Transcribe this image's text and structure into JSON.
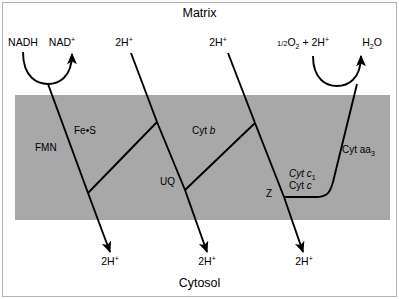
{
  "figure": {
    "width": 399,
    "height": 299
  },
  "colors": {
    "membrane_gray": "#a8a8a8",
    "line_black": "#000000",
    "background": "#ffffff",
    "frame_gray": "#b4b4b4"
  },
  "compartments": {
    "top_label": "Matrix",
    "bottom_label": "Cytosol"
  },
  "membrane": {
    "x": 15,
    "y": 95,
    "width": 375,
    "height": 125
  },
  "substrates": {
    "nadh": "NADH",
    "nad_base": "NAD",
    "nad_charge": "+",
    "oxygen_frac": "1/2",
    "oxygen_base": "O",
    "oxygen_sub": "2",
    "plus": "+",
    "protons_base": "2H",
    "protons_charge": "+",
    "water_base": "H",
    "water_sub": "2",
    "water_element": "O"
  },
  "proton_labels_top": [
    {
      "base": "2H",
      "charge": "+",
      "x": 124,
      "y": 43
    },
    {
      "base": "2H",
      "charge": "+",
      "x": 218,
      "y": 43
    }
  ],
  "proton_labels_bottom": [
    {
      "base": "2H",
      "charge": "+",
      "x": 96,
      "y": 262
    },
    {
      "base": "2H",
      "charge": "+",
      "x": 193,
      "y": 262
    },
    {
      "base": "2H",
      "charge": "+",
      "x": 290,
      "y": 262
    }
  ],
  "carriers": [
    {
      "name": "FMN",
      "display": "FMN",
      "italic": false,
      "x": 35,
      "y": 148
    },
    {
      "name": "Fe-S",
      "display": "Fe•S",
      "italic": false,
      "x": 74,
      "y": 131
    },
    {
      "name": "Cyt b",
      "display_prefix": "Cyt ",
      "display_italic": "b",
      "italic": true,
      "x": 192,
      "y": 131
    },
    {
      "name": "UQ",
      "display": "UQ",
      "italic": false,
      "x": 160,
      "y": 182
    },
    {
      "name": "Cyt c1",
      "display_prefix": "Cyt c",
      "subscript": "1",
      "italic": true,
      "x": 289,
      "y": 174
    },
    {
      "name": "Cyt c",
      "display_prefix": "Cyt ",
      "display_italic": "c",
      "italic": true,
      "x": 289,
      "y": 186
    },
    {
      "name": "Z",
      "display": "Z",
      "italic": false,
      "x": 272,
      "y": 194
    },
    {
      "name": "Cyt aa3",
      "display_prefix": "Cyt aa",
      "subscript": "3",
      "italic": true,
      "x": 342,
      "y": 150
    }
  ],
  "complexes": [
    {
      "label": "Complex I",
      "entry": "NADH",
      "exit": "NAD+",
      "carriers": [
        "FMN",
        "Fe-S"
      ],
      "protons_pumped": "2H+"
    },
    {
      "label": "Complex III",
      "carriers": [
        "Cyt b",
        "UQ",
        "Cyt c1"
      ],
      "protons_pumped": "2H+"
    },
    {
      "label": "Complex IV",
      "carriers": [
        "Cyt c",
        "Cyt aa3"
      ],
      "terminal_acceptor": "1/2O2 + 2H+",
      "product": "H2O",
      "protons_pumped": "2H+"
    }
  ]
}
